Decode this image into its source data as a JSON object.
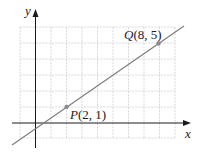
{
  "diagram": {
    "type": "coordinate-plane-line",
    "axes": {
      "x_label": "x",
      "y_label": "y"
    },
    "grid": {
      "x_min": -2,
      "x_max": 9,
      "y_min": -1,
      "y_max": 6,
      "unit": 1
    },
    "points": [
      {
        "name": "P",
        "x": 2,
        "y": 1,
        "label": "P(2, 1)",
        "label_name": "P",
        "label_coords": "(2, 1)"
      },
      {
        "name": "Q",
        "x": 8,
        "y": 5,
        "label": "Q(8, 5)",
        "label_name": "Q",
        "label_coords": "(8, 5)"
      }
    ],
    "line": {
      "through": [
        "P",
        "Q"
      ],
      "slope": "2/3"
    },
    "colors": {
      "grid": "#c8c8c8",
      "axis": "#1a1a1a",
      "line": "#7a7a7a",
      "point": "#8a8a8a"
    }
  }
}
